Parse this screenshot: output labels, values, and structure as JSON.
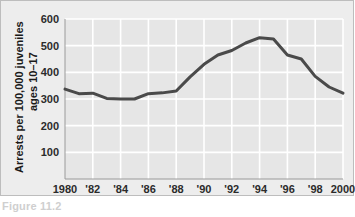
{
  "figure": {
    "background_color": "#ededed",
    "plot_background_color": "#e6e6e6",
    "gridline_color": "#ffffff",
    "axis_color": "#9a9a9a",
    "caption": "Figure 11.2"
  },
  "chart_data": {
    "type": "line",
    "title": "",
    "xlabel": "",
    "ylabel": "Arrests per 100,000 juveniles ages 10–17",
    "ylabel_line1": "Arrests per 100,000 juveniles",
    "ylabel_line2": "ages 10–17",
    "xlim": [
      1980,
      2000
    ],
    "ylim": [
      0,
      600
    ],
    "yticks": [
      100,
      200,
      300,
      400,
      500,
      600
    ],
    "ytick_labels": [
      "100",
      "200",
      "300",
      "400",
      "500",
      "600"
    ],
    "xticks": [
      1980,
      1982,
      1984,
      1986,
      1988,
      1990,
      1992,
      1994,
      1996,
      1998,
      2000
    ],
    "xtick_labels": [
      "1980",
      "'82",
      "'84",
      "'86",
      "'88",
      "'90",
      "'92",
      "'94",
      "'96",
      "'98",
      "2000"
    ],
    "grid": true,
    "legend": false,
    "series": [
      {
        "name": "Juvenile violent crime arrest rate",
        "color": "#4a4a4a",
        "line_width": 3,
        "x": [
          1980,
          1981,
          1982,
          1983,
          1984,
          1985,
          1986,
          1987,
          1988,
          1989,
          1990,
          1991,
          1992,
          1993,
          1994,
          1995,
          1996,
          1997,
          1998,
          1999,
          2000
        ],
        "values": [
          337,
          320,
          322,
          302,
          300,
          300,
          320,
          323,
          330,
          383,
          430,
          465,
          482,
          510,
          530,
          525,
          465,
          450,
          385,
          345,
          322
        ]
      }
    ]
  }
}
